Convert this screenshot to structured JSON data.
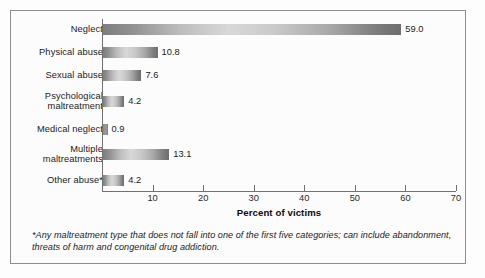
{
  "chart_data": {
    "type": "bar",
    "orientation": "horizontal",
    "title": "",
    "xlabel": "Percent of victims",
    "ylabel": "",
    "xlim": [
      0,
      70
    ],
    "xticks": [
      0,
      10,
      20,
      30,
      40,
      50,
      60,
      70
    ],
    "xtick_labels": [
      "",
      "10",
      "20",
      "30",
      "40",
      "50",
      "60",
      "70"
    ],
    "grid": false,
    "legend": false,
    "categories": [
      "Neglect",
      "Physical abuse",
      "Sexual abuse",
      "Psychological maltreatment",
      "Medical neglect",
      "Multiple maltreatments",
      "Other abuse*"
    ],
    "values": [
      59.0,
      10.8,
      7.6,
      4.2,
      0.9,
      13.1,
      4.2
    ],
    "value_labels": [
      "59.0",
      "10.8",
      "7.6",
      "4.2",
      "0.9",
      "13.1",
      "4.2"
    ]
  },
  "categories": [
    {
      "line1": "Neglect",
      "line2": "",
      "value": 59.0,
      "label": "59.0"
    },
    {
      "line1": "Physical abuse",
      "line2": "",
      "value": 10.8,
      "label": "10.8"
    },
    {
      "line1": "Sexual abuse",
      "line2": "",
      "value": 7.6,
      "label": "7.6"
    },
    {
      "line1": "Psychological",
      "line2": "maltreatment",
      "value": 4.2,
      "label": "4.2"
    },
    {
      "line1": "Medical neglect",
      "line2": "",
      "value": 0.9,
      "label": "0.9"
    },
    {
      "line1": "Multiple",
      "line2": "maltreatments",
      "value": 13.1,
      "label": "13.1"
    },
    {
      "line1": "Other abuse*",
      "line2": "",
      "value": 4.2,
      "label": "4.2"
    }
  ],
  "axis": {
    "title": "Percent of victims",
    "ticks": [
      "",
      "10",
      "20",
      "30",
      "40",
      "50",
      "60",
      "70"
    ]
  },
  "footnote": {
    "text": "*Any maltreatment type that does not fall into one of the first five categories; can include abandonment, threats of harm and congenital drug addiction."
  },
  "colors": {
    "bar_dark": "#7e7e7e",
    "bar_light": "#d8d8d8",
    "axis": "#6f7173",
    "frame": "#8d8f92",
    "text": "#1b1b1b"
  }
}
